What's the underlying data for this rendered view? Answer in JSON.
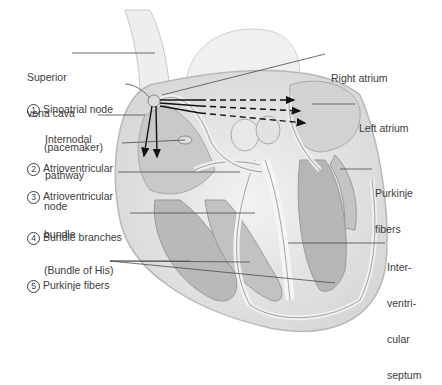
{
  "diagram": {
    "type": "cardiac conduction system illustration",
    "labels_left": [
      {
        "id": "superior_vena_cava",
        "number": "",
        "line1": "Superior",
        "line2": "vena cava",
        "line3": ""
      },
      {
        "id": "sa_node",
        "number": "1",
        "line1": "Sinoatrial node",
        "line2": "(pacemaker)",
        "line3": ""
      },
      {
        "id": "internodal_pathway",
        "number": "",
        "line1": "Internodal",
        "line2": "pathway",
        "line3": ""
      },
      {
        "id": "av_node",
        "number": "2",
        "line1": "Atrioventricular",
        "line2": "node",
        "line3": ""
      },
      {
        "id": "av_bundle",
        "number": "3",
        "line1": "Atrioventricular",
        "line2": "bundle",
        "line3": "(Bundle of His)"
      },
      {
        "id": "bundle_branches",
        "number": "4",
        "line1": "Bundle branches",
        "line2": "",
        "line3": ""
      },
      {
        "id": "purkinje_fibers_left",
        "number": "5",
        "line1": "Purkinje fibers",
        "line2": "",
        "line3": ""
      }
    ],
    "labels_right": [
      {
        "id": "right_atrium",
        "line1": "Right atrium",
        "line2": "",
        "line3": "",
        "line4": ""
      },
      {
        "id": "left_atrium",
        "line1": "Left atrium",
        "line2": "",
        "line3": "",
        "line4": ""
      },
      {
        "id": "purkinje_fibers_right",
        "line1": "Purkinje",
        "line2": "fibers",
        "line3": "",
        "line4": ""
      },
      {
        "id": "interventricular_septum",
        "line1": "Inter-",
        "line2": "ventri-",
        "line3": "cular",
        "line4": "septum"
      }
    ],
    "colors": {
      "label_text": "#3c3c3c",
      "leader_line": "#4a4a4a",
      "heart_fill": "#e6e6e6",
      "chamber_fill": "#bdbdbd",
      "arrow": "#111111"
    }
  }
}
